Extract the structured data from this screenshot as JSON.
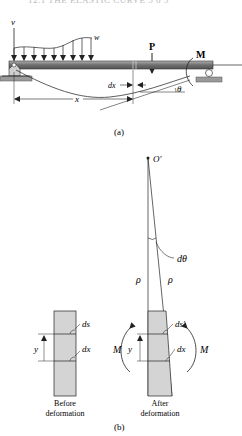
{
  "page_header": "12.1  THE ELASTIC CURVE   5 6 5",
  "figure_a": {
    "caption": "(a)",
    "labels": {
      "v_axis": "v",
      "distributed_load": "w",
      "point_load": "P",
      "moment": "M",
      "element_width": "dx",
      "position": "x",
      "slope_angle": "θ"
    }
  },
  "figure_b": {
    "caption": "(b)",
    "labels": {
      "center_of_curvature": "O′",
      "angle": "dθ",
      "radius_left": "ρ",
      "radius_right": "ρ",
      "before_ds": "ds",
      "before_dx": "dx",
      "before_y": "y",
      "after_ds": "ds′",
      "after_dx": "dx",
      "after_y": "y",
      "moment_left": "M",
      "moment_right": "M"
    },
    "before_caption_line1": "Before",
    "before_caption_line2": "deformation",
    "after_caption_line1": "After",
    "after_caption_line2": "deformation"
  },
  "colors": {
    "beam": "#7a7a7a",
    "element_fill": "#d4d4d4",
    "ground": "#9a9a9a",
    "line": "#222222"
  }
}
